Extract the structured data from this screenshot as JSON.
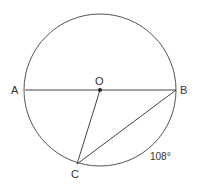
{
  "diagram": {
    "type": "circle-geometry",
    "circle": {
      "cx": 100,
      "cy": 90,
      "r": 76
    },
    "points": {
      "A": {
        "label": "A",
        "x": 25,
        "y": 90
      },
      "B": {
        "label": "B",
        "x": 176,
        "y": 90
      },
      "O": {
        "label": "O",
        "x": 100,
        "y": 90
      },
      "C": {
        "label": "C",
        "x": 77,
        "y": 163
      }
    },
    "segments": [
      "AB",
      "OC",
      "BC"
    ],
    "annotations": {
      "arc_label": "108°"
    },
    "colors": {
      "stroke": "#444444",
      "text": "#333333"
    }
  }
}
